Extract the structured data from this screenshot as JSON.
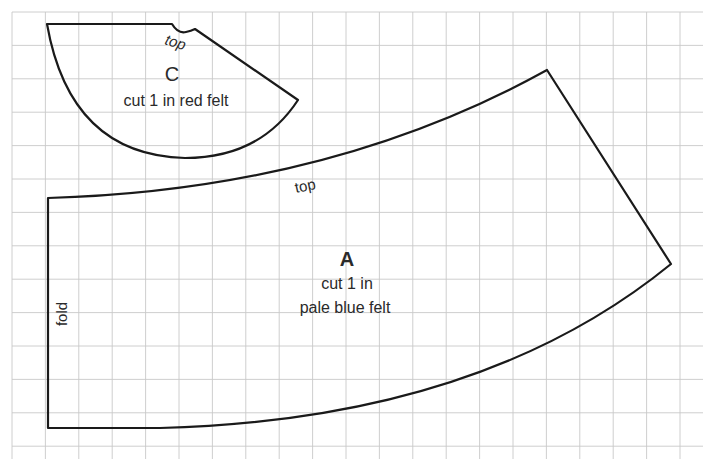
{
  "pattern": {
    "grid": {
      "left": 12,
      "top": 12,
      "right": 703,
      "bottom": 459,
      "spacing": 33.4,
      "line_color": "#c8c8c8"
    },
    "outline_color": "#1a1a1a",
    "pieces": [
      {
        "id": "C",
        "letter": "C",
        "instruction": "cut 1 in red felt",
        "edge_label": "top"
      },
      {
        "id": "A",
        "letter": "A",
        "instruction_line1": "cut 1 in",
        "instruction_line2": "pale blue felt",
        "edge_label": "top",
        "fold_label": "fold"
      }
    ]
  }
}
